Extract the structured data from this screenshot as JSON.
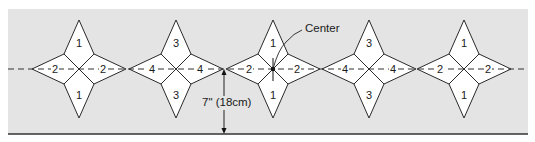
{
  "diagram": {
    "background_color": "#e4e4e4",
    "line_color": "#2a2a2a",
    "center_line_y": 69,
    "stars": [
      {
        "cx": 79,
        "top_label": "1",
        "bottom_label": "1",
        "left_label": "2",
        "right_label": "2"
      },
      {
        "cx": 176,
        "top_label": "3",
        "bottom_label": "3",
        "left_label": "4",
        "right_label": "4"
      },
      {
        "cx": 273,
        "top_label": "1",
        "bottom_label": "1",
        "left_label": "2",
        "right_label": "2"
      },
      {
        "cx": 369,
        "top_label": "3",
        "bottom_label": "3",
        "left_label": "4",
        "right_label": "4"
      },
      {
        "cx": 464,
        "top_label": "1",
        "bottom_label": "1",
        "left_label": "2",
        "right_label": "2"
      }
    ],
    "center_annotation": {
      "label": "Center"
    },
    "measurement": {
      "label": "7\" (18cm)"
    }
  }
}
